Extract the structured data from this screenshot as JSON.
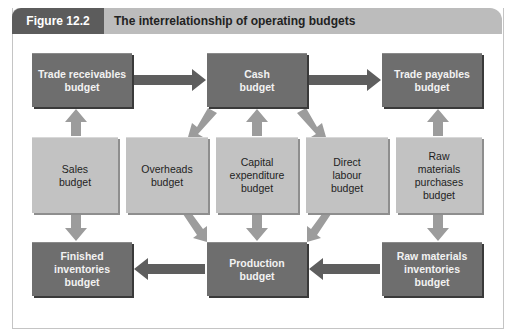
{
  "header": {
    "figure_label": "Figure 12.2",
    "title": "The interrelationship of operating budgets"
  },
  "colors": {
    "dark_box": "#6e6e6e",
    "light_box": "#c2c2c2",
    "dark_arrow": "#5e5e5e",
    "light_arrow": "#9c9c9c",
    "label_pill": "#5c5c5c",
    "title_bar": "#bcbcbc"
  },
  "diagram": {
    "top_row": [
      {
        "id": "trade-receivables",
        "label": "Trade receivables\nbudget"
      },
      {
        "id": "cash",
        "label": "Cash\nbudget"
      },
      {
        "id": "trade-payables",
        "label": "Trade payables\nbudget"
      }
    ],
    "middle_row": [
      {
        "id": "sales",
        "label": "Sales\nbudget"
      },
      {
        "id": "overheads",
        "label": "Overheads\nbudget"
      },
      {
        "id": "capital-expenditure",
        "label": "Capital\nexpenditure\nbudget"
      },
      {
        "id": "direct-labour",
        "label": "Direct\nlabour\nbudget"
      },
      {
        "id": "raw-materials-purchases",
        "label": "Raw\nmaterials\npurchases\nbudget"
      }
    ],
    "bottom_row": [
      {
        "id": "finished-inventories",
        "label": "Finished\ninventories\nbudget"
      },
      {
        "id": "production",
        "label": "Production\nbudget"
      },
      {
        "id": "raw-materials-inventories",
        "label": "Raw materials\ninventories\nbudget"
      }
    ],
    "edges": [
      {
        "from": "trade-receivables",
        "to": "cash"
      },
      {
        "from": "cash",
        "to": "trade-payables"
      },
      {
        "from": "sales",
        "to": "trade-receivables"
      },
      {
        "from": "sales",
        "to": "finished-inventories"
      },
      {
        "from": "cash",
        "to": "overheads"
      },
      {
        "from": "capital-expenditure",
        "to": "cash"
      },
      {
        "from": "cash",
        "to": "direct-labour"
      },
      {
        "from": "raw-materials-purchases",
        "to": "trade-payables"
      },
      {
        "from": "raw-materials-purchases",
        "to": "raw-materials-inventories"
      },
      {
        "from": "overheads",
        "to": "production"
      },
      {
        "from": "capital-expenditure",
        "to": "production"
      },
      {
        "from": "direct-labour",
        "to": "production"
      },
      {
        "from": "production",
        "to": "finished-inventories"
      },
      {
        "from": "raw-materials-inventories",
        "to": "production"
      }
    ]
  }
}
